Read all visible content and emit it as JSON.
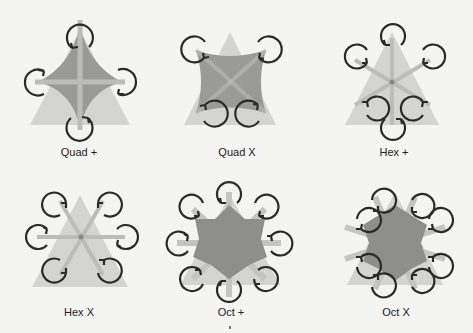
{
  "diagram": {
    "title": "",
    "colors": {
      "background": "#f4f4f2",
      "triangle": "#d4d4d2",
      "body": "#9a9a98",
      "arm": "#bcbcba",
      "rotor_stroke": "#2a2a2a",
      "label": "#222222"
    },
    "configurations": [
      {
        "id": "quad-plus",
        "label": "Quad +",
        "rotors": 4,
        "orientation": "plus"
      },
      {
        "id": "quad-x",
        "label": "Quad X",
        "rotors": 4,
        "orientation": "x"
      },
      {
        "id": "hex-plus",
        "label": "Hex +",
        "rotors": 6,
        "orientation": "plus"
      },
      {
        "id": "hex-x",
        "label": "Hex X",
        "rotors": 6,
        "orientation": "x"
      },
      {
        "id": "oct-plus",
        "label": "Oct +",
        "rotors": 8,
        "orientation": "plus"
      },
      {
        "id": "oct-x",
        "label": "Oct X",
        "rotors": 8,
        "orientation": "x"
      }
    ]
  }
}
